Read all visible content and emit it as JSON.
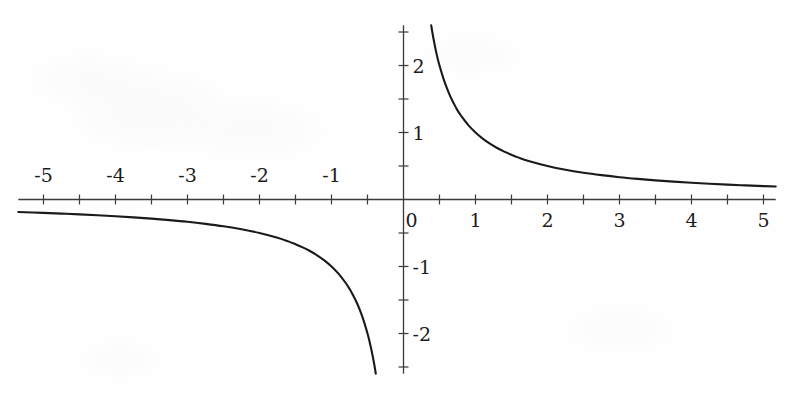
{
  "figure": {
    "kind": "cartesian-plot",
    "background_color": "#fefefe",
    "curve_color": "#1a1a1a",
    "axis_color": "#3a3a3a",
    "label_color": "#1d1d1d"
  },
  "chart_data": {
    "type": "line",
    "title": "",
    "subtitle": "",
    "xlabel": "",
    "ylabel": "",
    "function": "y = 1/x",
    "grid": false,
    "legend": null,
    "annotations": [],
    "xlim": [
      -5.35,
      5.17
    ],
    "ylim": [
      -2.6,
      2.6
    ],
    "x_major_ticks": [
      -5,
      -4,
      -3,
      -2,
      -1,
      0,
      1,
      2,
      3,
      4,
      5
    ],
    "x_minor_ticks": [
      -4.5,
      -3.5,
      -2.5,
      -1.5,
      -0.5,
      0.5,
      1.5,
      2.5,
      3.5,
      4.5
    ],
    "y_major_ticks": [
      -2,
      -1,
      0,
      1,
      2
    ],
    "y_minor_ticks": [
      -2.5,
      -1.5,
      -0.5,
      0.5,
      1.5,
      2.5
    ],
    "x_tick_labels_negative": [
      "-5",
      "-4",
      "-3",
      "-2",
      "-1"
    ],
    "x_tick_labels_positive": [
      "0",
      "1",
      "2",
      "3",
      "4",
      "5"
    ],
    "y_tick_labels": [
      "2",
      "1",
      "0",
      "-1",
      "-2"
    ],
    "series": [
      {
        "name": "right-branch",
        "domain": [
          0.385,
          5.17
        ],
        "points": [
          [
            0.385,
            2.6
          ],
          [
            0.4,
            2.5
          ],
          [
            0.42,
            2.38
          ],
          [
            0.44,
            2.27
          ],
          [
            0.46,
            2.17
          ],
          [
            0.48,
            2.08
          ],
          [
            0.5,
            2.0
          ],
          [
            0.55,
            1.82
          ],
          [
            0.6,
            1.67
          ],
          [
            0.65,
            1.54
          ],
          [
            0.7,
            1.43
          ],
          [
            0.75,
            1.33
          ],
          [
            0.8,
            1.25
          ],
          [
            0.9,
            1.11
          ],
          [
            1.0,
            1.0
          ],
          [
            1.1,
            0.909
          ],
          [
            1.2,
            0.833
          ],
          [
            1.3,
            0.769
          ],
          [
            1.4,
            0.714
          ],
          [
            1.5,
            0.667
          ],
          [
            1.6,
            0.625
          ],
          [
            1.75,
            0.571
          ],
          [
            2.0,
            0.5
          ],
          [
            2.25,
            0.444
          ],
          [
            2.5,
            0.4
          ],
          [
            2.75,
            0.364
          ],
          [
            3.0,
            0.333
          ],
          [
            3.25,
            0.308
          ],
          [
            3.5,
            0.286
          ],
          [
            3.75,
            0.267
          ],
          [
            4.0,
            0.25
          ],
          [
            4.25,
            0.235
          ],
          [
            4.5,
            0.222
          ],
          [
            4.75,
            0.211
          ],
          [
            5.0,
            0.2
          ],
          [
            5.17,
            0.193
          ]
        ]
      },
      {
        "name": "left-branch",
        "domain": [
          -5.35,
          -0.385
        ],
        "points": [
          [
            -5.35,
            -0.187
          ],
          [
            -5.0,
            -0.2
          ],
          [
            -4.75,
            -0.211
          ],
          [
            -4.5,
            -0.222
          ],
          [
            -4.25,
            -0.235
          ],
          [
            -4.0,
            -0.25
          ],
          [
            -3.75,
            -0.267
          ],
          [
            -3.5,
            -0.286
          ],
          [
            -3.25,
            -0.308
          ],
          [
            -3.0,
            -0.333
          ],
          [
            -2.75,
            -0.364
          ],
          [
            -2.5,
            -0.4
          ],
          [
            -2.25,
            -0.444
          ],
          [
            -2.0,
            -0.5
          ],
          [
            -1.75,
            -0.571
          ],
          [
            -1.6,
            -0.625
          ],
          [
            -1.5,
            -0.667
          ],
          [
            -1.4,
            -0.714
          ],
          [
            -1.3,
            -0.769
          ],
          [
            -1.2,
            -0.833
          ],
          [
            -1.1,
            -0.909
          ],
          [
            -1.0,
            -1.0
          ],
          [
            -0.9,
            -1.111
          ],
          [
            -0.8,
            -1.25
          ],
          [
            -0.75,
            -1.333
          ],
          [
            -0.7,
            -1.429
          ],
          [
            -0.65,
            -1.538
          ],
          [
            -0.6,
            -1.667
          ],
          [
            -0.55,
            -1.818
          ],
          [
            -0.5,
            -2.0
          ],
          [
            -0.48,
            -2.083
          ],
          [
            -0.46,
            -2.174
          ],
          [
            -0.44,
            -2.273
          ],
          [
            -0.42,
            -2.381
          ],
          [
            -0.4,
            -2.5
          ],
          [
            -0.385,
            -2.6
          ]
        ]
      }
    ]
  }
}
